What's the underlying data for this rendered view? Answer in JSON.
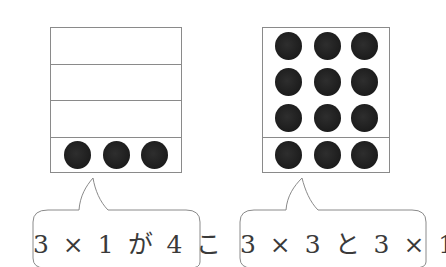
{
  "left_panel": {
    "box": {
      "rows": 4,
      "filled_rows": 1,
      "dots_per_row": 3
    },
    "caption": "3 × 1 が 4 こ"
  },
  "right_panel": {
    "box": {
      "rows_top_group": 3,
      "rows_bottom_group": 1,
      "dots_per_row": 3
    },
    "caption": "3 × 3 と 3 × 1"
  },
  "colors": {
    "line": "#8a8a8a",
    "dot": "#1c1c1c",
    "text": "#3a3a3a"
  },
  "icons": {
    "dot": "filled-circle",
    "speech_bubble": "rounded-speech-bubble"
  }
}
